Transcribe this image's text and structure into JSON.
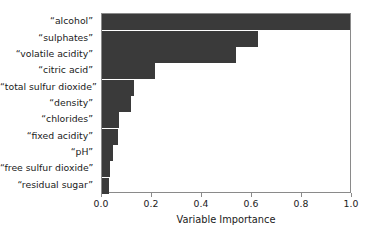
{
  "chart_data": {
    "type": "bar",
    "orientation": "horizontal",
    "title": "",
    "xlabel": "Variable Importance",
    "ylabel": "",
    "xlim": [
      0.0,
      1.0
    ],
    "grid": false,
    "legend": null,
    "bar_color": "#3a3a3a",
    "frame_color": "#8a8a8a",
    "xticks": [
      "0.0",
      "0.2",
      "0.4",
      "0.6",
      "0.8",
      "1.0"
    ],
    "xtick_values": [
      0.0,
      0.2,
      0.4,
      0.6,
      0.8,
      1.0
    ],
    "categories": [
      "“alcohol”",
      "“sulphates”",
      "“volatile acidity”",
      "“citric acid”",
      "“total sulfur dioxide”",
      "“density”",
      "“chlorides”",
      "“fixed acidity”",
      "“pH”",
      "“free sulfur dioxide”",
      "“residual sugar”"
    ],
    "values": [
      1.0,
      0.625,
      0.535,
      0.21,
      0.128,
      0.115,
      0.068,
      0.062,
      0.042,
      0.032,
      0.027
    ]
  }
}
